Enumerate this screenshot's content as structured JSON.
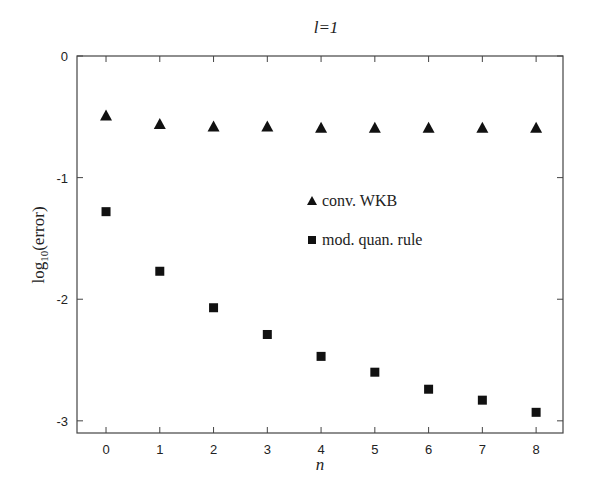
{
  "chart_data": {
    "type": "scatter",
    "title": "l=1",
    "xlabel": "n",
    "ylabel": "log10(error)",
    "xlim": [
      -0.54,
      8.5
    ],
    "ylim": [
      -3.1,
      0
    ],
    "x_ticks": [
      0,
      1,
      2,
      3,
      4,
      5,
      6,
      7,
      8
    ],
    "y_ticks": [
      0,
      -1,
      -2,
      -3
    ],
    "grid": false,
    "legend_position": "inside-center",
    "x": [
      0,
      1,
      2,
      3,
      4,
      5,
      6,
      7,
      8
    ],
    "series": [
      {
        "name": "conv. WKB",
        "marker": "triangle",
        "color": "#111111",
        "values": [
          -0.49,
          -0.56,
          -0.58,
          -0.58,
          -0.59,
          -0.59,
          -0.59,
          -0.59,
          -0.59
        ]
      },
      {
        "name": "mod. quan. rule",
        "marker": "square",
        "color": "#111111",
        "values": [
          -1.28,
          -1.77,
          -2.07,
          -2.29,
          -2.47,
          -2.6,
          -2.74,
          -2.83,
          -2.93
        ]
      }
    ]
  },
  "labels": {
    "title_l": "l",
    "title_eq": "=1",
    "ylabel_log": "log",
    "ylabel_sub": "10",
    "ylabel_rest": "(error)",
    "xlabel": "n"
  },
  "colors": {
    "axis": "#444444",
    "marker": "#111111",
    "text": "#222222"
  }
}
